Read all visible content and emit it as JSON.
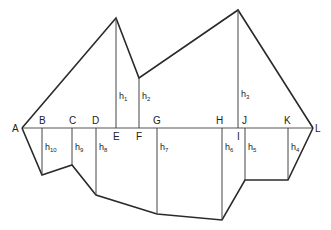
{
  "diagram": {
    "type": "surveying-offsets-area",
    "baseline": {
      "y": 128,
      "points": [
        {
          "id": "A",
          "label": "A",
          "x": 22
        },
        {
          "id": "B",
          "label": "B",
          "x": 42
        },
        {
          "id": "C",
          "label": "C",
          "x": 72
        },
        {
          "id": "D",
          "label": "D",
          "x": 96
        },
        {
          "id": "E",
          "label": "E",
          "x": 116
        },
        {
          "id": "F",
          "label": "F",
          "x": 139
        },
        {
          "id": "G",
          "label": "G",
          "x": 157
        },
        {
          "id": "H",
          "label": "H",
          "x": 222
        },
        {
          "id": "I",
          "label": "I",
          "x": 238
        },
        {
          "id": "J",
          "label": "J",
          "x": 245
        },
        {
          "id": "K",
          "label": "K",
          "x": 288
        },
        {
          "id": "L",
          "label": "L",
          "x": 313
        }
      ]
    },
    "upper_boundary": [
      [
        22,
        128
      ],
      [
        116,
        18
      ],
      [
        139,
        78
      ],
      [
        238,
        10
      ],
      [
        313,
        128
      ]
    ],
    "lower_boundary": [
      [
        22,
        128
      ],
      [
        42,
        175
      ],
      [
        72,
        165
      ],
      [
        96,
        195
      ],
      [
        157,
        214
      ],
      [
        222,
        220
      ],
      [
        245,
        180
      ],
      [
        288,
        180
      ],
      [
        313,
        128
      ]
    ],
    "offsets": [
      {
        "name": "h",
        "sub": "1",
        "x": 116,
        "y1": 18,
        "y2": 128,
        "side": "upper"
      },
      {
        "name": "h",
        "sub": "2",
        "x": 139,
        "y1": 78,
        "y2": 128,
        "side": "upper"
      },
      {
        "name": "h",
        "sub": "3",
        "x": 238,
        "y1": 10,
        "y2": 128,
        "side": "upper"
      },
      {
        "name": "h",
        "sub": "4",
        "x": 288,
        "y1": 128,
        "y2": 180,
        "side": "lower"
      },
      {
        "name": "h",
        "sub": "5",
        "x": 245,
        "y1": 128,
        "y2": 180,
        "side": "lower"
      },
      {
        "name": "h",
        "sub": "6",
        "x": 222,
        "y1": 128,
        "y2": 220,
        "side": "lower"
      },
      {
        "name": "h",
        "sub": "7",
        "x": 157,
        "y1": 128,
        "y2": 214,
        "side": "lower"
      },
      {
        "name": "h",
        "sub": "8",
        "x": 96,
        "y1": 128,
        "y2": 195,
        "side": "lower"
      },
      {
        "name": "h",
        "sub": "9",
        "x": 72,
        "y1": 128,
        "y2": 165,
        "side": "lower"
      },
      {
        "name": "h",
        "sub": "10",
        "x": 42,
        "y1": 128,
        "y2": 175,
        "side": "lower"
      }
    ],
    "colors": {
      "line": "#2a2a2a",
      "background": "#ffffff"
    }
  }
}
